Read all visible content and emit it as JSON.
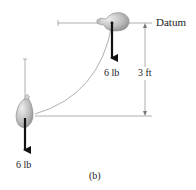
{
  "figure": {
    "caption": "(b)",
    "datum_label": "Datum",
    "height_label": "3 ft",
    "top_weight_label": "6 lb",
    "bottom_weight_label": "6 lb"
  },
  "colors": {
    "line": "#9a9a9a",
    "arrow": "#111111",
    "bag_fill": "#b8b8b8",
    "bag_highlight": "#e6e6e6"
  }
}
